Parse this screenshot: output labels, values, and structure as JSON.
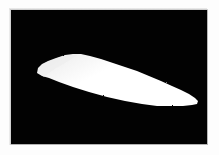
{
  "figure": {
    "kind": "binary-segmentation-mask",
    "alt_description": "White elongated tapered blob silhouette on a solid black background",
    "canvas_size": {
      "width": 196,
      "height": 134
    },
    "background_color": "#020202",
    "foreground_color": "#ffffff",
    "page_background_color": "#fdfdfd",
    "frame": {
      "x": 11,
      "y": 10,
      "width": 196,
      "height": 134
    },
    "edge_texture": "dithered",
    "object_count": 1
  },
  "mask_shape": {
    "name": "white-blob-region",
    "fill": "#ffffff",
    "shading_fill": "#ededed",
    "extent_px": {
      "left": 26,
      "top": 43,
      "right": 187,
      "bottom": 96
    },
    "leftmost_tip": {
      "x": 26,
      "y": 62
    },
    "rightmost_tip": {
      "x": 187,
      "y": 92
    },
    "top_peak": {
      "x": 62,
      "y": 44
    },
    "bottom_low": {
      "x": 152,
      "y": 95
    },
    "outline_path": "M 26 63 L 27 58 L 31 54 L 37 51 L 45 48 L 54 45 L 62 44 L 70 44 L 79 46 L 90 49 L 102 53 L 114 57 L 126 61 L 138 66 L 150 71 L 161 76 L 170 80 L 178 84 L 184 88 L 187 91 L 186 94 L 181 95 L 172 96 L 160 96 L 146 96 L 131 94 L 114 91 L 96 87 L 78 82 L 62 77 L 48 72 L 38 68 L 31 66 Z",
    "shading_path": "M 28 62 L 31 55 L 39 51 L 50 47 L 60 45 L 68 44 L 62 48 L 54 53 L 45 58 L 38 63 L 33 67 Z"
  },
  "chart_data": {
    "type": "heatmap",
    "title": "",
    "xlabel": "",
    "ylabel": "",
    "categories": [],
    "values": []
  }
}
